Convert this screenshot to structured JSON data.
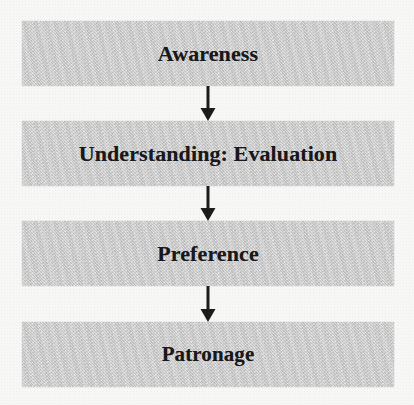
{
  "diagram": {
    "orientation": "vertical-top-down",
    "background_color": "#f7f7f6",
    "node_fill_color": "#c9c9c9",
    "node_text_color": "#17171a",
    "arrow_color": "#1a1a1a",
    "nodes": [
      {
        "id": "awareness",
        "label": "Awareness"
      },
      {
        "id": "understanding-evaluation",
        "label": "Understanding: Evaluation"
      },
      {
        "id": "preference",
        "label": "Preference"
      },
      {
        "id": "patronage",
        "label": "Patronage"
      }
    ],
    "connectors": [
      {
        "id": "arrow-0",
        "from": "awareness",
        "to": "understanding-evaluation",
        "icon": "arrow-down-icon"
      },
      {
        "id": "arrow-1",
        "from": "understanding-evaluation",
        "to": "preference",
        "icon": "arrow-down-icon"
      },
      {
        "id": "arrow-2",
        "from": "preference",
        "to": "patronage",
        "icon": "arrow-down-icon"
      }
    ]
  }
}
